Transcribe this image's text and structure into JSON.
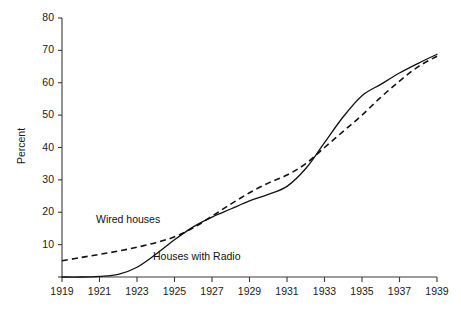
{
  "chart_data": {
    "type": "line",
    "title": "",
    "xlabel": "",
    "ylabel": "Percent",
    "xlim": [
      1919,
      1939
    ],
    "ylim": [
      0,
      80
    ],
    "grid": false,
    "legend_position": "inline-annotations",
    "xticks": [
      "1919",
      "1921",
      "1923",
      "1925",
      "1927",
      "1929",
      "1931",
      "1933",
      "1935",
      "1937",
      "1939"
    ],
    "yticks": [
      "0",
      "10",
      "20",
      "30",
      "40",
      "50",
      "60",
      "70",
      "80"
    ],
    "x": [
      1919,
      1920,
      1921,
      1922,
      1923,
      1924,
      1925,
      1926,
      1927,
      1928,
      1929,
      1930,
      1931,
      1932,
      1933,
      1934,
      1935,
      1936,
      1937,
      1938,
      1939
    ],
    "series": [
      {
        "name": "Wired houses",
        "style": "dashed",
        "color": "#111111",
        "annotation": "Wired houses",
        "values": [
          5.0,
          6.0,
          7.0,
          8.0,
          9.2,
          10.6,
          12.4,
          15.2,
          18.8,
          22.5,
          26.0,
          29.0,
          31.5,
          35.0,
          40.0,
          45.0,
          50.0,
          55.5,
          60.5,
          65.0,
          68.2
        ]
      },
      {
        "name": "Houses with Radio",
        "style": "solid",
        "color": "#111111",
        "annotation": "Houses with Radio",
        "values": [
          0.0,
          0.0,
          0.2,
          0.8,
          3.0,
          7.0,
          11.5,
          15.5,
          18.5,
          21.0,
          23.5,
          25.5,
          28.0,
          33.5,
          41.5,
          49.5,
          56.0,
          59.5,
          63.0,
          66.0,
          68.8
        ]
      }
    ],
    "annotations": [
      {
        "text": "Wired houses",
        "x_px": 96,
        "y_px": 213
      },
      {
        "text": "Houses with Radio",
        "x_px": 153,
        "y_px": 250
      }
    ]
  },
  "axes": {
    "y_title": "Percent"
  }
}
